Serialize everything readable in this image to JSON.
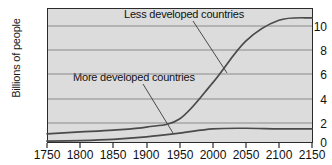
{
  "chart_data": {
    "type": "line",
    "title": "",
    "xlabel": "",
    "ylabel": "Billions of people",
    "xlim": [
      1750,
      2150
    ],
    "ylim": [
      0,
      11
    ],
    "xticks": [
      1750,
      1800,
      1850,
      1900,
      1950,
      2000,
      2050,
      2100,
      2150
    ],
    "yticks": [
      0,
      2,
      4,
      6,
      8,
      10
    ],
    "grid": true,
    "legend_position": "inline-annotations",
    "x": [
      1750,
      1800,
      1850,
      1900,
      1950,
      2000,
      2050,
      2100,
      2150
    ],
    "series": [
      {
        "name": "Less developed countries",
        "values": [
          0.75,
          0.9,
          1.05,
          1.3,
          1.95,
          4.9,
          8.3,
          10.0,
          10.2
        ]
      },
      {
        "name": "More developed countries",
        "values": [
          0.15,
          0.2,
          0.3,
          0.5,
          0.8,
          1.15,
          1.2,
          1.15,
          1.15
        ]
      }
    ],
    "annotations": [
      {
        "text": "Less developed countries",
        "target_series": "Less developed countries"
      },
      {
        "text": "More developed countries",
        "target_series": "More developed countries"
      }
    ]
  },
  "axes": {
    "y_title": "Billions of people",
    "y_tick_labels": [
      "10",
      "8",
      "6",
      "4",
      "2",
      "0"
    ],
    "x_tick_labels": [
      "1750",
      "1800",
      "1850",
      "1900",
      "1950",
      "2000",
      "2050",
      "2100",
      "2150"
    ]
  },
  "labels": {
    "upper_curve": "Less developed countries",
    "lower_curve": "More developed countries"
  },
  "colors": {
    "plot_background": "#dcdcdc",
    "axis": "#2b2b2b",
    "gridline": "#8a8a8a",
    "curve": "#4a4a4a",
    "text": "#111111",
    "page_background": "#ffffff"
  }
}
